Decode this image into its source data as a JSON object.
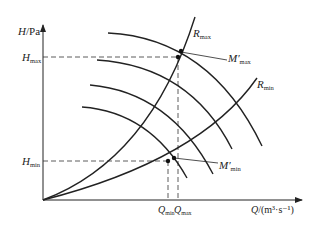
{
  "diagram": {
    "type": "pump-system operating curves",
    "y_axis": {
      "label_var": "H",
      "label_unit": "/Pa"
    },
    "x_axis": {
      "label_var": "Q",
      "label_unit": "/(m³·s⁻¹)"
    },
    "h_ticks": [
      {
        "main": "H",
        "sub": "max"
      },
      {
        "main": "H",
        "sub": "min"
      }
    ],
    "q_ticks": [
      {
        "main": "Q",
        "sub": "min"
      },
      {
        "main": "Q",
        "sub": "max"
      }
    ],
    "curve_labels": {
      "r_max": {
        "main": "R",
        "sub": "max"
      },
      "r_min": {
        "main": "R",
        "sub": "min"
      },
      "m_max": {
        "main": "M′",
        "sub": "max"
      },
      "m_min": {
        "main": "M′",
        "sub": "min"
      }
    },
    "pump_curve_count": 4,
    "colors": {
      "line": "#222222",
      "background": "#ffffff"
    }
  }
}
